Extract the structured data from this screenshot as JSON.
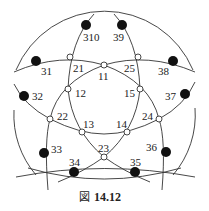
{
  "figure": {
    "caption_prefix": "図",
    "caption_number": "14.12"
  },
  "nodes": {
    "outer": [
      {
        "id": "310",
        "label": "310",
        "x": 86,
        "y": 25,
        "lx": 83,
        "ly": 41
      },
      {
        "id": "39",
        "label": "39",
        "x": 122,
        "y": 25,
        "lx": 113,
        "ly": 41
      },
      {
        "id": "31",
        "label": "31",
        "x": 36,
        "y": 61,
        "lx": 41,
        "ly": 75
      },
      {
        "id": "38",
        "label": "38",
        "x": 173,
        "y": 61,
        "lx": 158,
        "ly": 75
      },
      {
        "id": "32",
        "label": "32",
        "x": 24,
        "y": 96,
        "lx": 32,
        "ly": 100
      },
      {
        "id": "37",
        "label": "37",
        "x": 185,
        "y": 94,
        "lx": 165,
        "ly": 100
      },
      {
        "id": "33",
        "label": "33",
        "x": 44,
        "y": 153,
        "lx": 51,
        "ly": 153
      },
      {
        "id": "36",
        "label": "36",
        "x": 166,
        "y": 152,
        "lx": 146,
        "ly": 151
      },
      {
        "id": "34",
        "label": "34",
        "x": 74,
        "y": 172,
        "lx": 69,
        "ly": 166
      },
      {
        "id": "35",
        "label": "35",
        "x": 135,
        "y": 172,
        "lx": 130,
        "ly": 166
      }
    ],
    "inner": [
      {
        "id": "21",
        "label": "21",
        "x": 70,
        "y": 57,
        "lx": 73,
        "ly": 72
      },
      {
        "id": "25",
        "label": "25",
        "x": 138,
        "y": 57,
        "lx": 124,
        "ly": 72
      },
      {
        "id": "11",
        "label": "11",
        "x": 104,
        "y": 65,
        "lx": 98,
        "ly": 80
      },
      {
        "id": "12",
        "label": "12",
        "x": 68,
        "y": 89,
        "lx": 75,
        "ly": 97
      },
      {
        "id": "15",
        "label": "15",
        "x": 140,
        "y": 89,
        "lx": 124,
        "ly": 97
      },
      {
        "id": "22",
        "label": "22",
        "x": 50,
        "y": 119,
        "lx": 57,
        "ly": 120
      },
      {
        "id": "24",
        "label": "24",
        "x": 159,
        "y": 119,
        "lx": 142,
        "ly": 120
      },
      {
        "id": "13",
        "label": "13",
        "x": 82,
        "y": 132,
        "lx": 83,
        "ly": 128
      },
      {
        "id": "14",
        "label": "14",
        "x": 127,
        "y": 132,
        "lx": 116,
        "ly": 128
      },
      {
        "id": "23",
        "label": "23",
        "x": 104,
        "y": 157,
        "lx": 98,
        "ly": 152
      }
    ]
  },
  "colors": {
    "stroke": "#333333",
    "node_fill": "#111111",
    "background": "#ffffff"
  }
}
